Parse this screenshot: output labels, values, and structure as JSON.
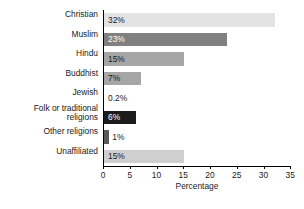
{
  "chart_data": {
    "type": "bar",
    "orientation": "horizontal",
    "title": "",
    "xlabel": "Percentage",
    "ylabel": "",
    "xlim": [
      0,
      35
    ],
    "xticks": [
      0,
      5,
      10,
      15,
      20,
      25,
      30,
      35
    ],
    "grid": false,
    "legend": false,
    "categories": [
      "Christian",
      "Muslim",
      "Hindu",
      "Buddhist",
      "Jewish",
      "Folk or traditional\nreligions",
      "Other religions",
      "Unaffiliated"
    ],
    "values": [
      32,
      23,
      15,
      7,
      0.2,
      6,
      1,
      15
    ],
    "data_labels": [
      "32%",
      "23%",
      "15%",
      "7%",
      "0.2%",
      "6%",
      "1%",
      "15%"
    ],
    "bar_colors": [
      "#e3e3e3",
      "#808080",
      "#a6a6a6",
      "#a6a6a6",
      "#ffffff",
      "#1c1c1c",
      "#595959",
      "#cfcfcf"
    ],
    "label_colors": [
      "#1a1a1a",
      "#ffffff",
      "#1a1a1a",
      "#1a1a1a",
      "#1a1a1a",
      "#ffffff",
      "#1a1a1a",
      "#1a1a1a"
    ]
  }
}
